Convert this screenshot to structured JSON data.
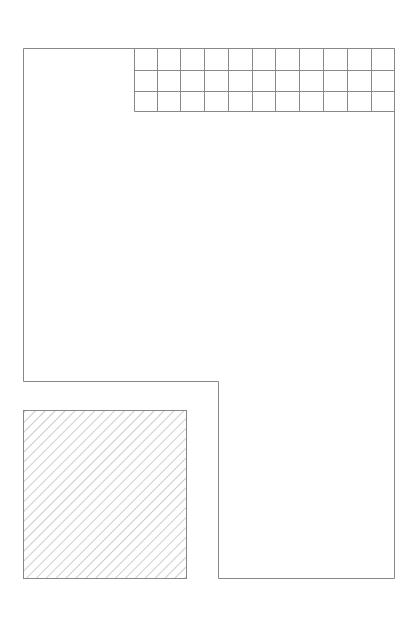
{
  "diagram": {
    "stroke_color": "#888888",
    "hatch_color": "#999999",
    "background": "#ffffff",
    "outline": {
      "points": [
        [
          23,
          48
        ],
        [
          394,
          48
        ],
        [
          394,
          578
        ],
        [
          218,
          578
        ],
        [
          218,
          381
        ],
        [
          23,
          381
        ]
      ]
    },
    "grid": {
      "x": 134,
      "y": 48,
      "col_lines": [
        134,
        157,
        180,
        204,
        228,
        252,
        275,
        299,
        323,
        347,
        371,
        394
      ],
      "row_lines": [
        48,
        70,
        91,
        111
      ],
      "columns": 11,
      "rows": 3
    },
    "hatched_box": {
      "x": 23,
      "y": 410,
      "width": 163,
      "height": 168,
      "hatch_spacing": 7,
      "hatch_angle": 45
    }
  }
}
